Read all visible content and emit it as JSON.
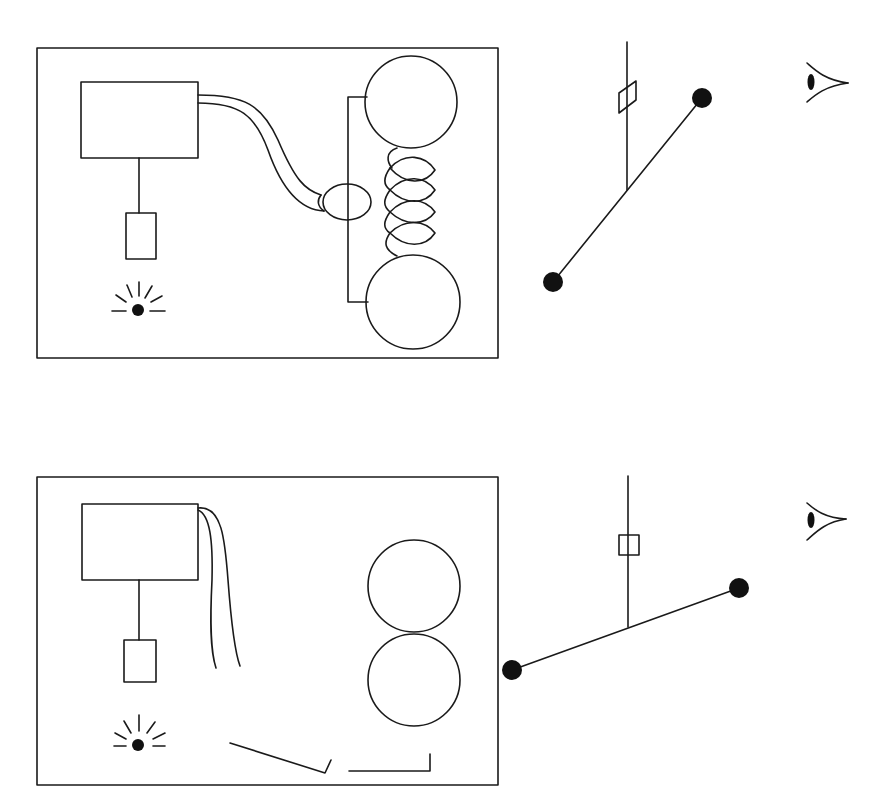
{
  "diagram": {
    "panels": [
      {
        "id": "top",
        "state": "wires connected to electromagnet; rollers held apart by coil spring; lever tilted steeply",
        "elements": [
          "control-box",
          "pendant-weight",
          "lamp",
          "wire-pair",
          "electromagnet-ring",
          "upper-roller",
          "lower-roller",
          "coil-spring",
          "frame-bracket"
        ]
      },
      {
        "id": "bottom",
        "state": "wires disconnected; rollers touching; lever tilted shallow",
        "elements": [
          "control-box",
          "pendant-weight",
          "lamp",
          "loose-wires",
          "upper-roller",
          "lower-roller",
          "floor-bracket-left",
          "floor-bracket-right"
        ]
      }
    ],
    "lever_assemblies": [
      {
        "id": "top-lever",
        "state": "steep tilt",
        "elements": [
          "pivot-post",
          "marker-flag",
          "lever-arm",
          "weight-ball-left",
          "weight-ball-right",
          "observer-eye"
        ]
      },
      {
        "id": "bottom-lever",
        "state": "shallow tilt",
        "elements": [
          "pivot-post",
          "marker-flag",
          "lever-arm",
          "weight-ball-left",
          "weight-ball-right",
          "observer-eye"
        ]
      }
    ],
    "colors": {
      "stroke": "#1a1a1a",
      "fill": "#111111",
      "background": "#ffffff"
    }
  }
}
